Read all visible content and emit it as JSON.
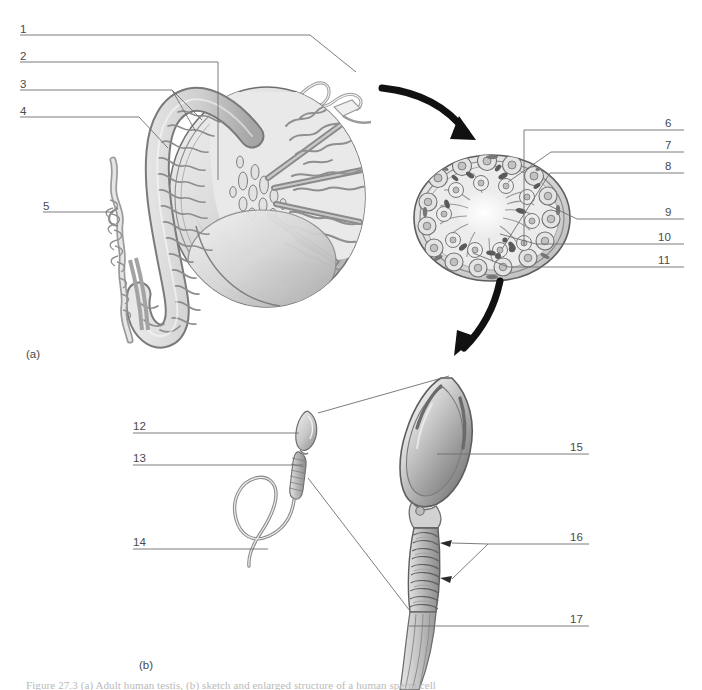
{
  "figure": {
    "page_width": 702,
    "page_height": 690,
    "background_color": "#ffffff",
    "line_color": "#6e6e6e",
    "arrow_color": "#111111",
    "ink_dark": "#4a4a4a",
    "ink_mid": "#8e8e8e",
    "ink_light": "#cfcfcf",
    "caption": "Figure 27.3   (a) Adult human testis, (b) sketch and enlarged structure of a human sperm cell",
    "caption_color": "#b9b9b9"
  },
  "panels": [
    {
      "id": "panel-a",
      "tag": "(a)",
      "x": 26,
      "y": 348
    },
    {
      "id": "panel-b",
      "tag": "(b)",
      "x": 139,
      "y": 659
    }
  ],
  "leaders": {
    "left_column": [
      {
        "num": "1",
        "num_x": 20,
        "num_y": 24,
        "line_y": 35,
        "line_x1": 20,
        "line_x2": 310
      },
      {
        "num": "2",
        "num_x": 20,
        "num_y": 51,
        "line_y": 62,
        "line_x1": 20,
        "line_x2": 218
      },
      {
        "num": "3",
        "num_x": 20,
        "num_y": 79,
        "line_y": 90,
        "line_x1": 20,
        "line_x2": 172
      },
      {
        "num": "4",
        "num_x": 20,
        "num_y": 106,
        "line_y": 117,
        "line_x1": 20,
        "line_x2": 139
      },
      {
        "num": "5",
        "num_x": 43,
        "num_y": 201,
        "line_y": 212,
        "line_x1": 43,
        "line_x2": 113
      }
    ],
    "right_column_top": [
      {
        "num": "6",
        "num_x": 665,
        "num_y": 118,
        "line_y": 130,
        "line_x1": 524,
        "line_x2": 684
      },
      {
        "num": "7",
        "num_x": 665,
        "num_y": 140,
        "line_y": 152,
        "line_x1": 551,
        "line_x2": 684
      },
      {
        "num": "8",
        "num_x": 665,
        "num_y": 161,
        "line_y": 173,
        "line_x1": 550,
        "line_x2": 684
      },
      {
        "num": "9",
        "num_x": 665,
        "num_y": 207,
        "line_y": 219,
        "line_x1": 577,
        "line_x2": 684
      },
      {
        "num": "10",
        "num_x": 658,
        "num_y": 232,
        "line_y": 244,
        "line_x1": 536,
        "line_x2": 684
      },
      {
        "num": "11",
        "num_x": 658,
        "num_y": 255,
        "line_y": 267,
        "line_x1": 508,
        "line_x2": 684
      }
    ],
    "bottom_left_column": [
      {
        "num": "12",
        "num_x": 133,
        "num_y": 421,
        "line_y": 433,
        "line_x1": 133,
        "line_x2": 299
      },
      {
        "num": "13",
        "num_x": 133,
        "num_y": 453,
        "line_y": 465,
        "line_x1": 133,
        "line_x2": 303
      },
      {
        "num": "14",
        "num_x": 133,
        "num_y": 537,
        "line_y": 549,
        "line_x1": 133,
        "line_x2": 268
      }
    ],
    "bottom_right_column": [
      {
        "num": "15",
        "num_x": 570,
        "num_y": 442,
        "line_y": 454,
        "line_x1": 437,
        "line_x2": 589
      },
      {
        "num": "16",
        "num_x": 570,
        "num_y": 532,
        "line_y": 544,
        "line_x1": 488,
        "line_x2": 589
      },
      {
        "num": "17",
        "num_x": 570,
        "num_y": 614,
        "line_y": 626,
        "line_x1": 409,
        "line_x2": 589
      }
    ]
  },
  "diagram_a": {
    "title": "Adult human testis, longitudinal section with epididymis",
    "parts": [
      {
        "key": "vas_deferens",
        "label_num": "1"
      },
      {
        "key": "efferent_ductules",
        "label_num": "2"
      },
      {
        "key": "head_of_epididymis",
        "label_num": "3"
      },
      {
        "key": "body_of_epididymis",
        "label_num": "4"
      },
      {
        "key": "tail_of_epididymis",
        "label_num": "5"
      }
    ]
  },
  "diagram_cross_section": {
    "title": "Seminiferous tubule cross-section",
    "parts": [
      {
        "key": "lumen",
        "label_num": "6"
      },
      {
        "key": "spermatids",
        "label_num": "7"
      },
      {
        "key": "sertoli_cell",
        "label_num": "8"
      },
      {
        "key": "basement_membrane",
        "label_num": "9"
      },
      {
        "key": "spermatocyte",
        "label_num": "10"
      },
      {
        "key": "spermatogonium",
        "label_num": "11"
      }
    ]
  },
  "diagram_b": {
    "title": "Human sperm cell, whole and enlarged",
    "parts": [
      {
        "key": "head",
        "label_num": "12"
      },
      {
        "key": "midpiece",
        "label_num": "13"
      },
      {
        "key": "tail_flagellum",
        "label_num": "14"
      },
      {
        "key": "nucleus",
        "label_num": "15"
      },
      {
        "key": "mitochondria",
        "label_num": "16"
      },
      {
        "key": "axial_filament",
        "label_num": "17"
      }
    ]
  },
  "arrows": [
    {
      "key": "arrow-testis-to-tubule",
      "from": "testis",
      "to": "tubule-cross-section"
    },
    {
      "key": "arrow-tubule-to-sperm",
      "from": "tubule-cross-section",
      "to": "sperm"
    }
  ]
}
